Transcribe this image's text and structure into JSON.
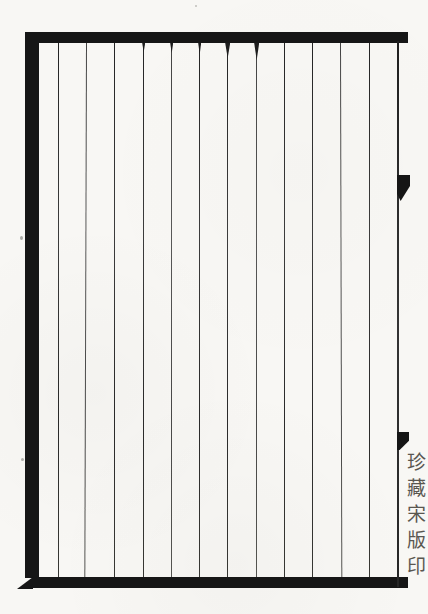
{
  "label": {
    "text": "珍藏宋版印"
  },
  "colors": {
    "border_ink": "#161616",
    "rule_ink": "#2f2f2f",
    "label_ink": "#45423a",
    "paper": "#f8f7f4"
  }
}
